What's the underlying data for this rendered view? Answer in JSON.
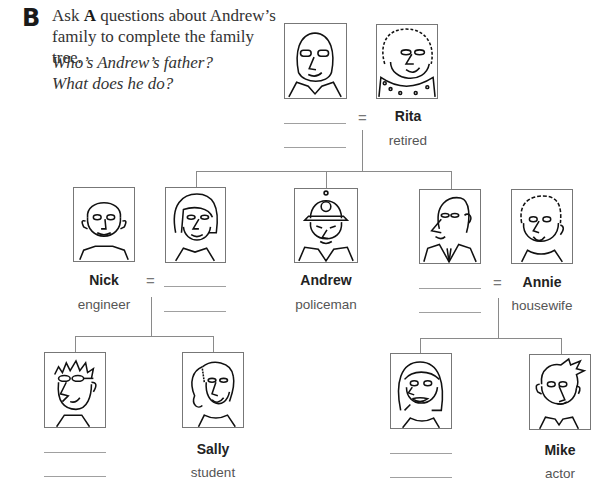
{
  "exercise": {
    "letter": "B",
    "instruction_pre": "Ask ",
    "instruction_bold": "A",
    "instruction_post": " questions about Andrew’s family to complete the family tree.",
    "example_questions": [
      "Who’s Andrew’s father?",
      "What does he do?"
    ]
  },
  "equals_sign": "=",
  "family": {
    "grandfather": {
      "name": "",
      "job": "",
      "icon": "bald-man-glasses-portrait"
    },
    "grandmother": {
      "name": "Rita",
      "job": "retired",
      "icon": "curly-hair-woman-portrait"
    },
    "nick": {
      "name": "Nick",
      "job": "engineer",
      "icon": "man-stubble-portrait"
    },
    "nick_wife": {
      "name": "",
      "job": "",
      "icon": "woman-bob-hair-portrait"
    },
    "andrew": {
      "name": "Andrew",
      "job": "policeman",
      "icon": "policeman-helmet-portrait"
    },
    "annie_husband": {
      "name": "",
      "job": "",
      "icon": "bald-man-suit-portrait"
    },
    "annie": {
      "name": "Annie",
      "job": "housewife",
      "icon": "short-hair-woman-portrait"
    },
    "nick_son": {
      "name": "",
      "job": "",
      "icon": "spiky-hair-boy-glasses-portrait"
    },
    "sally": {
      "name": "Sally",
      "job": "student",
      "icon": "ponytail-girl-portrait"
    },
    "annie_daughter": {
      "name": "",
      "job": "",
      "icon": "long-hair-girl-portrait"
    },
    "mike": {
      "name": "Mike",
      "job": "actor",
      "icon": "messy-hair-man-portrait"
    }
  }
}
